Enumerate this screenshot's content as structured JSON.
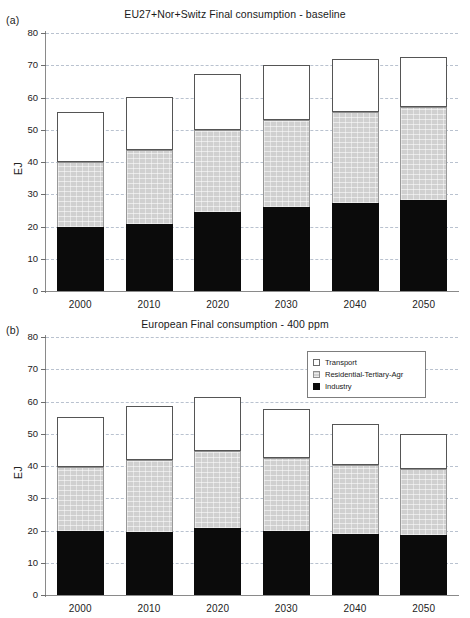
{
  "figure": {
    "ylabel": "EJ",
    "panels": [
      {
        "letter": "(a)",
        "title": "EU27+Nor+Switz Final consumption - baseline"
      },
      {
        "letter": "(b)",
        "title": "European Final consumption - 400 ppm"
      }
    ],
    "legend": {
      "items": [
        {
          "label": "Transport",
          "swatch": "white-square-outline",
          "color": "#ffffff"
        },
        {
          "label": "Residential-Tertiary-Agr",
          "swatch": "gray-hatched-square",
          "color": "#d0d0d0"
        },
        {
          "label": "Industry",
          "swatch": "black-filled-square",
          "color": "#0b0b0b"
        }
      ]
    }
  },
  "chart_data": [
    {
      "type": "bar",
      "stacked": true,
      "panel": "(a)",
      "title": "EU27+Nor+Switz Final consumption - baseline",
      "xlabel": "",
      "ylabel": "EJ",
      "ylim": [
        0,
        80
      ],
      "yticks": [
        0,
        10,
        20,
        30,
        40,
        50,
        60,
        70,
        80
      ],
      "grid": true,
      "legend_position": "none",
      "categories": [
        "2000",
        "2010",
        "2020",
        "2030",
        "2040",
        "2050"
      ],
      "series": [
        {
          "name": "Industry",
          "color": "#0b0b0b",
          "values": [
            20.0,
            20.8,
            24.5,
            26.0,
            27.3,
            28.2
          ]
        },
        {
          "name": "Residential-Tertiary-Agr",
          "color": "#d0d0d0",
          "values": [
            20.0,
            22.9,
            25.4,
            27.0,
            28.3,
            28.8
          ]
        },
        {
          "name": "Transport",
          "color": "#ffffff",
          "values": [
            15.5,
            16.6,
            17.4,
            17.0,
            16.4,
            15.7
          ]
        }
      ],
      "cumulative_tops": {
        "industry": [
          20.0,
          20.8,
          24.5,
          26.0,
          27.3,
          28.2
        ],
        "residential_tertiary_agr": [
          40.0,
          43.7,
          49.9,
          53.0,
          55.6,
          57.0
        ],
        "transport": [
          55.5,
          60.3,
          67.3,
          70.0,
          72.0,
          72.7
        ]
      }
    },
    {
      "type": "bar",
      "stacked": true,
      "panel": "(b)",
      "title": "European Final consumption - 400 ppm",
      "xlabel": "",
      "ylabel": "EJ",
      "ylim": [
        0,
        80
      ],
      "yticks": [
        0,
        10,
        20,
        30,
        40,
        50,
        60,
        70,
        80
      ],
      "grid": true,
      "legend_position": "upper right",
      "categories": [
        "2000",
        "2010",
        "2020",
        "2030",
        "2040",
        "2050"
      ],
      "series": [
        {
          "name": "Industry",
          "color": "#0b0b0b",
          "values": [
            19.8,
            19.5,
            20.8,
            19.8,
            18.8,
            18.5
          ]
        },
        {
          "name": "Residential-Tertiary-Agr",
          "color": "#d0d0d0",
          "values": [
            19.9,
            22.5,
            23.7,
            22.7,
            21.6,
            20.7
          ]
        },
        {
          "name": "Transport",
          "color": "#ffffff",
          "values": [
            15.5,
            16.6,
            17.0,
            15.1,
            12.6,
            10.6
          ]
        }
      ],
      "cumulative_tops": {
        "industry": [
          19.8,
          19.5,
          20.8,
          19.8,
          18.8,
          18.5
        ],
        "residential_tertiary_agr": [
          39.7,
          42.0,
          44.5,
          42.5,
          40.4,
          39.2
        ],
        "transport": [
          55.2,
          58.6,
          61.5,
          57.6,
          53.0,
          49.8
        ]
      }
    }
  ]
}
